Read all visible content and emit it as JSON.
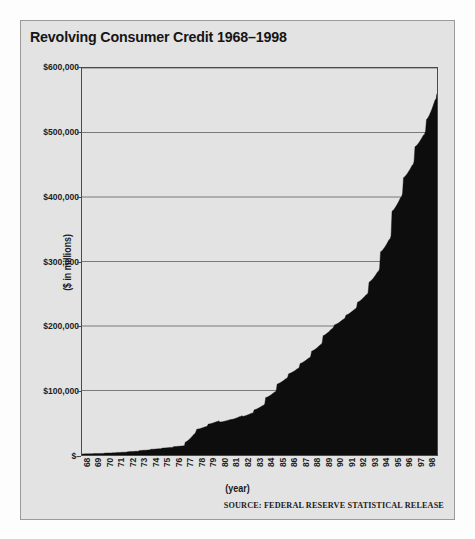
{
  "panel": {
    "title": "Revolving Consumer Credit 1968–1998",
    "source_note": "SOURCE: FEDERAL RESERVE STATISTICAL RELEASE",
    "background_color": "#e3e3e3",
    "border_color": "#9a9a9a"
  },
  "chart_data": {
    "type": "area",
    "title": "Revolving Consumer Credit 1968–1998",
    "subtitle": "",
    "xlabel": "(year)",
    "ylabel": "($ in millions)",
    "series_color": "#0d0d0d",
    "plot_background": "#e3e3e3",
    "grid": true,
    "grid_color": "#6e6e6e",
    "legend": "none",
    "ylim": [
      0,
      600000
    ],
    "ytick_values": [
      0,
      100000,
      200000,
      300000,
      400000,
      500000,
      600000
    ],
    "ytick_labels": [
      "$-",
      "$100,000",
      "$200,000",
      "$300,000",
      "$400,000",
      "$500,000",
      "$600,000"
    ],
    "xtick_labels": [
      "68",
      "69",
      "70",
      "71",
      "72",
      "73",
      "74",
      "75",
      "76",
      "77",
      "78",
      "79",
      "80",
      "81",
      "82",
      "83",
      "84",
      "85",
      "86",
      "87",
      "88",
      "89",
      "90",
      "91",
      "92",
      "93",
      "94",
      "95",
      "96",
      "97",
      "98"
    ],
    "x_note": "monthly observations, Jan 1968 through Dec 1998; December seasonal spikes visible as sawtooth peaks",
    "annotations": [
      "Series is near zero until the mid 1970s",
      "Step increase in level at 1977",
      "Steep acceleration from 1992 onward",
      "Peak near $560,000 at the end of 1998"
    ],
    "categories": [
      "1968",
      "1969",
      "1970",
      "1971",
      "1972",
      "1973",
      "1974",
      "1975",
      "1976",
      "1977",
      "1978",
      "1979",
      "1980",
      "1981",
      "1982",
      "1983",
      "1984",
      "1985",
      "1986",
      "1987",
      "1988",
      "1989",
      "1990",
      "1991",
      "1992",
      "1993",
      "1994",
      "1995",
      "1996",
      "1997",
      "1998"
    ],
    "values": [
      2000,
      2600,
      3500,
      4500,
      6000,
      8000,
      10000,
      12000,
      14500,
      36000,
      45000,
      53000,
      55000,
      61000,
      66000,
      79000,
      100000,
      121000,
      136000,
      153000,
      174000,
      199000,
      213000,
      229000,
      252000,
      289000,
      340000,
      406000,
      455000,
      502000,
      560000
    ],
    "values_note": "Year-end (December) levels in $ millions read from the plot",
    "monthly_series": {
      "name": "Revolving consumer credit outstanding",
      "units": "$ millions",
      "start": "1968-01",
      "end": "1998-12",
      "december_peaks": [
        2000,
        2600,
        3500,
        4500,
        6000,
        8000,
        10000,
        12000,
        14500,
        36000,
        45000,
        53000,
        55000,
        61000,
        66000,
        79000,
        100000,
        121000,
        136000,
        153000,
        174000,
        199000,
        213000,
        229000,
        252000,
        289000,
        340000,
        406000,
        455000,
        502000,
        560000
      ],
      "january_troughs": [
        1700,
        2200,
        3000,
        3900,
        5200,
        7000,
        8900,
        10800,
        13000,
        20000,
        40000,
        48000,
        51000,
        55000,
        60000,
        70000,
        89000,
        110000,
        126000,
        142000,
        161000,
        185000,
        202000,
        217000,
        237000,
        268000,
        315000,
        378000,
        430000,
        478000,
        520000
      ]
    }
  }
}
